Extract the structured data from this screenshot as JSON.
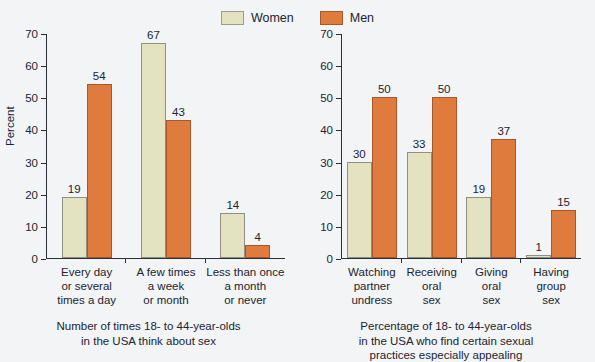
{
  "legend": {
    "items": [
      {
        "label": "Women",
        "color": "#e3e3c2",
        "swatch_name": "women-swatch"
      },
      {
        "label": "Men",
        "color": "#e07b3e",
        "swatch_name": "men-swatch"
      }
    ]
  },
  "left": {
    "ylabel": "Percent",
    "yticks": [
      "0",
      "10",
      "20",
      "30",
      "40",
      "50",
      "60",
      "70"
    ],
    "categories": [
      [
        "Every day",
        "or several",
        "times a day"
      ],
      [
        "A few times",
        "a week",
        "or month"
      ],
      [
        "Less than once",
        "a month",
        "or never"
      ]
    ],
    "values": {
      "women": [
        "19",
        "67",
        "14"
      ],
      "men": [
        "54",
        "43",
        "4"
      ]
    },
    "caption": [
      "Number of times 18- to 44-year-olds",
      "in the USA think about sex"
    ]
  },
  "right": {
    "ylabel": "",
    "yticks": [
      "0",
      "10",
      "20",
      "30",
      "40",
      "50",
      "60",
      "70"
    ],
    "categories": [
      [
        "Watching",
        "partner",
        "undress"
      ],
      [
        "Receiving",
        "oral",
        "sex"
      ],
      [
        "Giving",
        "oral",
        "sex"
      ],
      [
        "Having",
        "group",
        "sex"
      ]
    ],
    "values": {
      "women": [
        "30",
        "33",
        "19",
        "1"
      ],
      "men": [
        "50",
        "50",
        "37",
        "15"
      ]
    },
    "caption": [
      "Percentage of 18- to 44-year-olds",
      "in the USA who find certain sexual",
      "practices especially appealing"
    ]
  },
  "chart_data": [
    {
      "type": "bar",
      "title": "Number of times 18- to 44-year-olds in the USA think about sex",
      "xlabel": "",
      "ylabel": "Percent",
      "ylim": [
        0,
        70
      ],
      "yticks": [
        0,
        10,
        20,
        30,
        40,
        50,
        60,
        70
      ],
      "grid": false,
      "legend_position": "top-center",
      "categories": [
        "Every day or several times a day",
        "A few times a week or month",
        "Less than once a month or never"
      ],
      "series": [
        {
          "name": "Women",
          "color": "#e3e3c2",
          "values": [
            19,
            67,
            14
          ]
        },
        {
          "name": "Men",
          "color": "#e07b3e",
          "values": [
            54,
            43,
            4
          ]
        }
      ]
    },
    {
      "type": "bar",
      "title": "Percentage of 18- to 44-year-olds in the USA who find certain sexual practices especially appealing",
      "xlabel": "",
      "ylabel": "",
      "ylim": [
        0,
        70
      ],
      "yticks": [
        0,
        10,
        20,
        30,
        40,
        50,
        60,
        70
      ],
      "grid": false,
      "legend_position": "top-center",
      "categories": [
        "Watching partner undress",
        "Receiving oral sex",
        "Giving oral sex",
        "Having group sex"
      ],
      "series": [
        {
          "name": "Women",
          "color": "#e3e3c2",
          "values": [
            30,
            33,
            19,
            1
          ]
        },
        {
          "name": "Men",
          "color": "#e07b3e",
          "values": [
            50,
            50,
            37,
            15
          ]
        }
      ]
    }
  ]
}
